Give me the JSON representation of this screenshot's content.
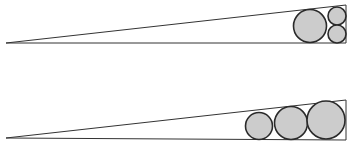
{
  "diagram": {
    "colors": {
      "background": "#ffffff",
      "line": "#333333",
      "circle_fill": "#cccccc",
      "circle_stroke": "#2a2a2a"
    },
    "figures": [
      {
        "name": "top-wedge",
        "triangle": [
          [
            6,
            43
          ],
          [
            346,
            43
          ],
          [
            346,
            5
          ]
        ],
        "circles": [
          {
            "cx": 310,
            "cy": 26,
            "r": 16.5
          },
          {
            "cx": 337,
            "cy": 16,
            "r": 9
          },
          {
            "cx": 337,
            "cy": 34,
            "r": 9
          }
        ]
      },
      {
        "name": "bottom-wedge",
        "triangle": [
          [
            6,
            138
          ],
          [
            346,
            140
          ],
          [
            346,
            100
          ]
        ],
        "circles": [
          {
            "cx": 259,
            "cy": 126,
            "r": 13.5
          },
          {
            "cx": 291,
            "cy": 123,
            "r": 16.5
          },
          {
            "cx": 326,
            "cy": 120,
            "r": 19
          }
        ]
      }
    ]
  }
}
